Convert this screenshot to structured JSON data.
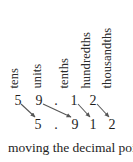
{
  "figure": {
    "type": "place-value-shift-diagram",
    "background_color": "#ffffff",
    "text_color": "#222222",
    "arrow_color": "#555555",
    "column_labels": [
      {
        "text": "tens",
        "x": 20
      },
      {
        "text": "units",
        "x": 43
      },
      {
        "text": "tenths",
        "x": 70
      },
      {
        "text": "hundredths",
        "x": 92
      },
      {
        "text": "thousandths",
        "x": 113
      }
    ],
    "top_row": {
      "number": "59.12",
      "cells": [
        {
          "char": "5",
          "x": 18
        },
        {
          "char": "9",
          "x": 39
        },
        {
          "char": ".",
          "x": 56
        },
        {
          "char": "1",
          "x": 74
        },
        {
          "char": "2",
          "x": 93
        }
      ]
    },
    "bottom_row": {
      "number": "5.912",
      "cells": [
        {
          "char": "5",
          "x": 38
        },
        {
          "char": ".",
          "x": 56
        },
        {
          "char": "9",
          "x": 75
        },
        {
          "char": "1",
          "x": 93
        },
        {
          "char": "2",
          "x": 112
        }
      ]
    },
    "arrows": [
      {
        "from_char": "5",
        "to_char": "5",
        "x1": 21,
        "y1": 104,
        "x2": 35,
        "y2": 117
      },
      {
        "from_char": "9",
        "to_char": "9",
        "x1": 43,
        "y1": 104,
        "x2": 71,
        "y2": 117
      },
      {
        "from_char": "1",
        "to_char": "1",
        "x1": 78,
        "y1": 104,
        "x2": 90,
        "y2": 117
      },
      {
        "from_char": "2",
        "to_char": "2",
        "x1": 97,
        "y1": 104,
        "x2": 109,
        "y2": 117
      }
    ],
    "caption": "moving the decimal poi"
  }
}
